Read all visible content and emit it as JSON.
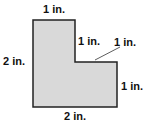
{
  "diagram": {
    "type": "L-shaped polygon",
    "fill_color": "#d9d9d9",
    "stroke_color": "#222222",
    "vertices": [
      [
        33,
        20
      ],
      [
        75,
        20
      ],
      [
        75,
        62
      ],
      [
        117,
        62
      ],
      [
        117,
        107
      ],
      [
        33,
        107
      ]
    ],
    "labels": {
      "top": "1 in.",
      "left": "2 in.",
      "inner_vertical": "1 in.",
      "inner_horizontal": "1 in.",
      "right": "1 in.",
      "bottom": "2 in."
    }
  }
}
